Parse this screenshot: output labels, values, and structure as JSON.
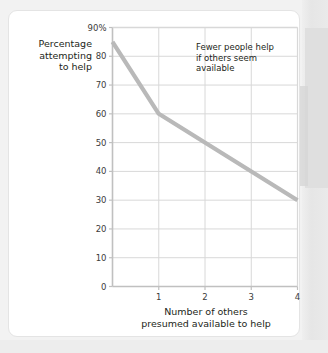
{
  "figure": {
    "y_axis_title_lines": [
      "Percentage",
      "attempting",
      "to help"
    ],
    "x_axis_title_lines": [
      "Number of others",
      "presumed available to help"
    ],
    "annotation_lines": [
      "Fewer people help",
      "if others seem",
      "available"
    ],
    "colors": {
      "line": "#b9b9b9",
      "grid": "#d8d8d8",
      "axis": "#c0c0c0",
      "text": "#231f20",
      "tick_text": "#3b3b3b",
      "card_bg": "#ffffff",
      "page_bg": "#f2f2f2"
    }
  },
  "chart_data": {
    "type": "line",
    "title": "",
    "subtitle": "",
    "xlabel": "Number of others presumed available to help",
    "ylabel": "Percentage attempting to help",
    "xlim": [
      0,
      4
    ],
    "ylim": [
      0,
      90
    ],
    "grid": true,
    "legend": "none",
    "x_tick_labels": [
      "1",
      "2",
      "3",
      "4"
    ],
    "x_tick_values": [
      1,
      2,
      3,
      4
    ],
    "y_tick_labels": [
      "0",
      "10",
      "20",
      "30",
      "40",
      "50",
      "60",
      "70",
      "80",
      "90%"
    ],
    "y_tick_values": [
      0,
      10,
      20,
      30,
      40,
      50,
      60,
      70,
      80,
      90
    ],
    "series": [
      {
        "name": "Percentage attempting to help",
        "x": [
          0,
          1,
          4
        ],
        "values": [
          85,
          60,
          30
        ]
      }
    ],
    "annotations": [
      {
        "text": "Fewer people help if others seem available",
        "x": 1.4,
        "y": 88
      }
    ]
  }
}
